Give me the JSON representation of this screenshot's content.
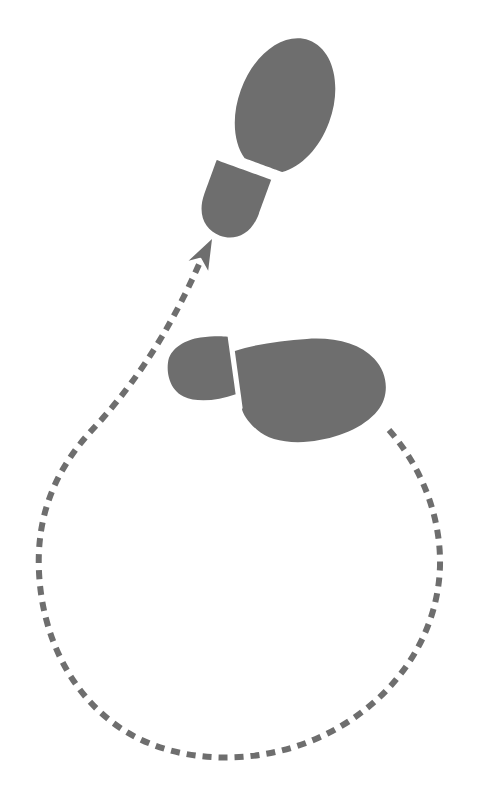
{
  "canvas": {
    "width": 477,
    "height": 798,
    "background_color": "#ffffff"
  },
  "illustration": {
    "title": "Walking footprints with dashed looping path",
    "description": "Two gray shoe-sole footprints, the lower one pointing right and the upper one pointing up-right, connected by a dashed gray line that loops clockwise down and around before arrowing up to the upper footprint.",
    "shape_color": "#6e6e6e",
    "path_color": "#6e6e6e"
  },
  "footprints": [
    {
      "name": "upper-footprint",
      "foot": "left",
      "heading_degrees": 20,
      "sole": {
        "center_x": 285,
        "center_y": 106,
        "radius_x": 47,
        "radius_y": 70,
        "rotation_degrees": 20
      },
      "heel": {
        "center_x": 233,
        "center_y": 200,
        "radius_x": 29,
        "radius_y": 36,
        "rotation_degrees": 20
      }
    },
    {
      "name": "lower-footprint",
      "foot": "right",
      "heading_degrees": 96,
      "sole": {
        "center_x": 310,
        "center_y": 390,
        "radius_x": 76,
        "radius_y": 50,
        "rotation_degrees": -8
      },
      "heel": {
        "center_x": 200,
        "center_y": 370,
        "radius_x": 32,
        "radius_y": 30,
        "rotation_degrees": -8
      }
    }
  ],
  "path": {
    "name": "dashed-loop-path",
    "style": "dashed",
    "dash_length": 9,
    "dash_gap": 7,
    "stroke_width": 6,
    "direction": "clockwise",
    "start_point": [
      389,
      430
    ],
    "end_point": [
      212,
      239
    ],
    "extents": {
      "left_x": 38,
      "right_x": 441,
      "bottom_y": 756,
      "top_y": 239
    },
    "svg_d": "M 389 430 C 424 470 441 520 440 566 C 438 640 390 706 318 738 C 255 766 178 764 125 731 C 72 698 42 637 39 572 C 36 512 58 467 92 430 C 124 396 168 340 206 248"
  },
  "arrowhead": {
    "name": "path-arrowhead",
    "tip_x": 212,
    "tip_y": 239,
    "angle_degrees": -63,
    "length": 30,
    "width": 22
  }
}
